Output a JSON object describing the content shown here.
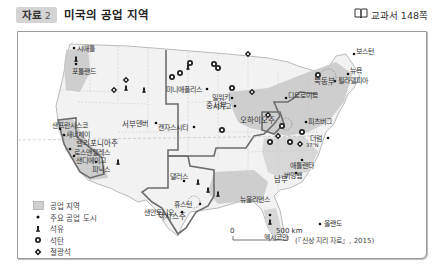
{
  "header": {
    "tag_label": "자료",
    "tag_number": "2",
    "title": "미국의 공업 지역",
    "textbook_icon": "book-icon",
    "textbook_ref": "교과서 148쪽"
  },
  "map": {
    "regions": [
      {
        "name": "서부",
        "color": "#b8b8b8"
      },
      {
        "name": "중서부",
        "color": "#b8b8b8"
      },
      {
        "name": "북동부",
        "color": "#b8b8b8"
      },
      {
        "name": "남부",
        "color": "#b8b8b8"
      }
    ],
    "states": [
      "캘리포니아주",
      "텍사스주",
      "오하이오주"
    ],
    "cities": [
      "시애틀",
      "포틀랜드",
      "샌프란시스코",
      "새너제이",
      "로스앤젤레스",
      "샌디에이고",
      "피닉스",
      "덴버",
      "미니애폴리스",
      "밀워키",
      "시카고",
      "캔자스시티",
      "디트로이트",
      "보스턴",
      "뉴욕",
      "필라델피아",
      "피츠버그",
      "더럼",
      "애틀랜타",
      "버밍햄",
      "댈러스",
      "휴스턴",
      "샌안토니오",
      "뉴올리언스",
      "올랜도"
    ],
    "water": [
      "멕시코만"
    ],
    "latitude_label": "37°N",
    "scale": {
      "zero": "0",
      "distance": "500 km"
    },
    "source": "(『신상 지리 자료』, 2015)"
  },
  "legend": {
    "items": [
      {
        "icon": "industrial-area-swatch",
        "label": "공업 지역"
      },
      {
        "icon": "major-city-dot",
        "label": "주요 공업 도시"
      },
      {
        "icon": "oil-icon",
        "label": "석유"
      },
      {
        "icon": "coal-icon",
        "label": "석탄"
      },
      {
        "icon": "iron-ore-icon",
        "label": "철광석"
      },
      {
        "icon": "high-tech-zone-circle",
        "label": "첨단 산업 지역"
      }
    ]
  }
}
